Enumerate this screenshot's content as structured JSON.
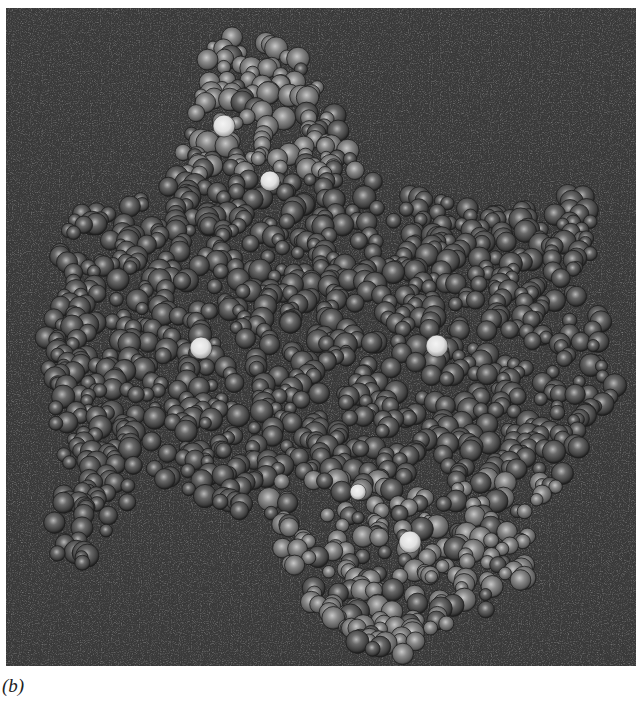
{
  "figure": {
    "caption": "(b)",
    "colors": {
      "background": "#3a3a3a",
      "atom_dark": "#4a4a4a",
      "atom_light": "#8a8a8a",
      "atom_highlight": "#e8e8e8"
    }
  }
}
